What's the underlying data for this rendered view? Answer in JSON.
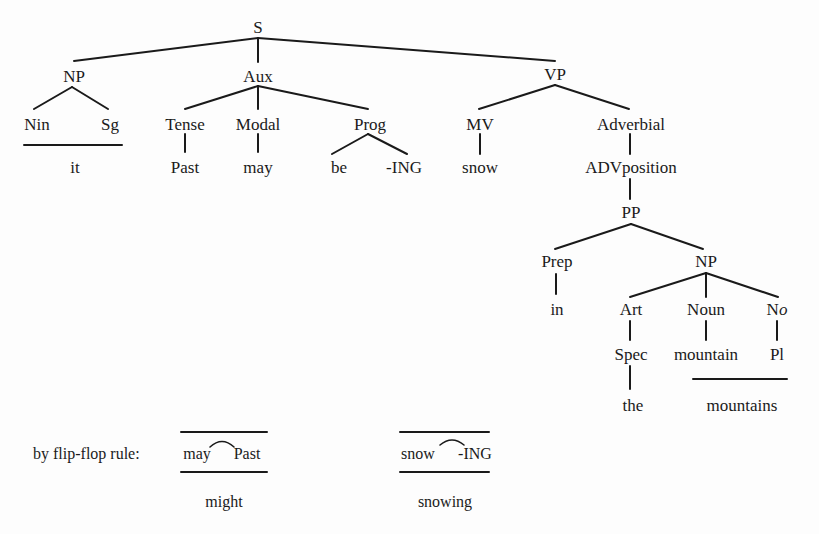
{
  "header_cutoff_text": "…ring-transformational derivation…",
  "tree": {
    "root": "S",
    "subject_np": {
      "label": "NP",
      "children": [
        "Nin",
        "Sg"
      ],
      "realization": "it"
    },
    "aux": {
      "label": "Aux",
      "tense": {
        "label": "Tense",
        "value": "Past"
      },
      "modal": {
        "label": "Modal",
        "value": "may"
      },
      "prog": {
        "label": "Prog",
        "children": [
          "be",
          "-ING"
        ]
      }
    },
    "vp": {
      "label": "VP",
      "mv": {
        "label": "MV",
        "value": "snow"
      },
      "adverbial": {
        "label": "Adverbial",
        "adv": "ADVposition",
        "pp": {
          "label": "PP",
          "prep": {
            "label": "Prep",
            "value": "in"
          },
          "np": {
            "label": "NP",
            "art": {
              "label": "Art",
              "spec": "Spec",
              "value": "the"
            },
            "noun": {
              "label": "Noun",
              "value": "mountain"
            },
            "no": {
              "label_prefix": "N",
              "label_suffix": "o",
              "value": "Pl"
            },
            "realization": "mountains"
          }
        }
      }
    }
  },
  "flip_flop": {
    "label": "by flip-flop rule:",
    "rule1": {
      "left": "may",
      "right": "Past",
      "result": "might"
    },
    "rule2": {
      "left": "snow",
      "right": "-ING",
      "result": "snowing"
    }
  },
  "colors": {
    "ink": "#1a1a1a",
    "paper": "#fdfdfd"
  }
}
